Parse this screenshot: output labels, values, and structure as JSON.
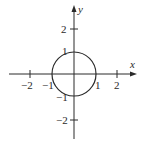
{
  "diagram": {
    "colors": {
      "stroke": "#2a2a2a",
      "background": "#ffffff"
    },
    "axes": {
      "x_label": "x",
      "y_label": "y",
      "x_ticks": [
        {
          "value": -2,
          "label": "−2"
        },
        {
          "value": -1,
          "label": "−1"
        },
        {
          "value": 1,
          "label": "1"
        },
        {
          "value": 2,
          "label": "2"
        }
      ],
      "y_ticks": [
        {
          "value": 2,
          "label": "2"
        },
        {
          "value": 1,
          "label": "1"
        },
        {
          "value": -1,
          "label": "−1"
        },
        {
          "value": -2,
          "label": "−2"
        }
      ]
    },
    "circle": {
      "center_x": 0,
      "center_y": 0,
      "radius": 1
    }
  }
}
